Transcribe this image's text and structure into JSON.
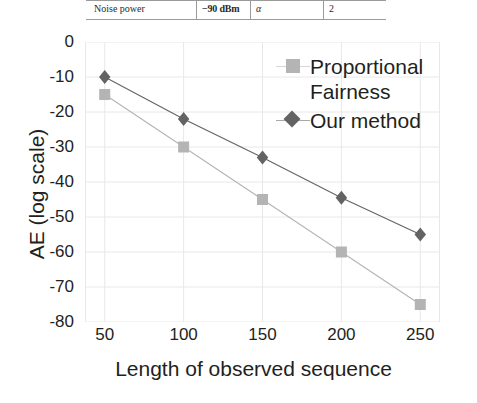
{
  "table_fragment": {
    "label": "Noise power",
    "value": "−90 dBm",
    "symbol": "α",
    "symbol_value": "2"
  },
  "legend": {
    "position": "top-right",
    "entries": [
      {
        "label": "Proportional\nFairness",
        "marker": "square-marker",
        "color": "#b4b4b4"
      },
      {
        "label": "Our method",
        "marker": "diamond-marker",
        "color": "#636363"
      }
    ]
  },
  "chart_data": {
    "type": "line",
    "title": "",
    "xlabel": "Length of observed sequence",
    "ylabel": "AE (log scale)",
    "x": [
      50,
      100,
      150,
      200,
      250
    ],
    "xticklabels": [
      "50",
      "100",
      "150",
      "200",
      "250"
    ],
    "yticklabels": [
      "0",
      "-10",
      "-20",
      "-30",
      "-40",
      "-50",
      "-60",
      "-70",
      "-80"
    ],
    "yticks": [
      0,
      -10,
      -20,
      -30,
      -40,
      -50,
      -60,
      -70,
      -80
    ],
    "xlim": [
      37.5,
      262.5
    ],
    "ylim": [
      -80,
      0
    ],
    "grid": true,
    "series": [
      {
        "name": "Proportional Fairness",
        "marker": "square",
        "color": "#b4b4b4",
        "values": [
          -15,
          -30,
          -45,
          -60,
          -75
        ]
      },
      {
        "name": "Our method",
        "marker": "diamond",
        "color": "#636363",
        "values": [
          -10,
          -22,
          -33,
          -44.5,
          -55
        ]
      }
    ]
  }
}
